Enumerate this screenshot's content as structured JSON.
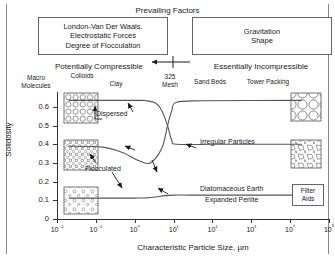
{
  "header": {
    "prevailing_factors": "Prevailing Factors",
    "left_box": {
      "line1": "London-Van Der Waals.",
      "line2": "Electrostatic Forces",
      "line3": "Degree of Flocculation"
    },
    "right_box": {
      "line1": "Gravitation",
      "line2": "Shape"
    }
  },
  "bands": {
    "potentially_compressible": "Potentially Compressible",
    "essentially_incompressible": "Essentially Incompressible",
    "items_left": [
      {
        "label_line1": "Macro",
        "label_line2": "Molecules"
      },
      {
        "label_line1": "Colloids",
        "label_line2": ""
      },
      {
        "label_line1": "Clay",
        "label_line2": ""
      }
    ],
    "items_right": [
      {
        "label_line1": "325",
        "label_line2": "Mesh"
      },
      {
        "label_line1": "Sand Beds",
        "label_line2": ""
      },
      {
        "label_line1": "Tower Packing",
        "label_line2": ""
      }
    ]
  },
  "annotations": {
    "dispersed": "Dispersed",
    "flocculated": "Flocculated",
    "irregular_particles": "Irregular Particles",
    "diatomaceous_earth": "Diatomaceous Earth",
    "expanded_perlite": "Expanded Perlite",
    "filter_aids_line1": "Filter",
    "filter_aids_line2": "Aids"
  },
  "chart_data": {
    "type": "line",
    "title": "",
    "xlabel": "Characteristic Particle Size, µm",
    "ylabel": "Solidosity",
    "xscale": "log",
    "xlim": [
      0.01,
      100000
    ],
    "ylim": [
      0,
      0.68
    ],
    "xticklabels": [
      "10⁻²",
      "10⁻¹",
      "10⁰",
      "10¹",
      "10²",
      "10³",
      "10⁴",
      "10⁵"
    ],
    "xtickvalues": [
      0.01,
      0.1,
      1,
      10,
      100,
      1000,
      10000,
      100000
    ],
    "yticklabels": [
      "0",
      "0.1",
      "0.2",
      "0.3",
      "0.4",
      "0.5",
      "0.6"
    ],
    "ytickvalues": [
      0,
      0.1,
      0.2,
      0.3,
      0.4,
      0.5,
      0.6
    ],
    "grid": false,
    "legend": "none",
    "series": [
      {
        "name": "Dispersed",
        "points": [
          [
            0.02,
            0.635
          ],
          [
            1.0,
            0.635
          ],
          [
            2.0,
            0.633
          ],
          [
            3.5,
            0.62
          ],
          [
            5.0,
            0.58
          ],
          [
            7.0,
            0.5
          ],
          [
            9.0,
            0.42
          ],
          [
            12.0,
            0.4
          ],
          [
            100,
            0.4
          ],
          [
            1000,
            0.4
          ],
          [
            20000,
            0.4
          ]
        ]
      },
      {
        "name": "Flocculated",
        "points": [
          [
            0.02,
            0.39
          ],
          [
            0.15,
            0.385
          ],
          [
            0.5,
            0.355
          ],
          [
            1.2,
            0.315
          ],
          [
            2.5,
            0.3
          ],
          [
            5.0,
            0.38
          ],
          [
            7.0,
            0.5
          ],
          [
            9.0,
            0.58
          ],
          [
            12.0,
            0.625
          ],
          [
            60,
            0.633
          ],
          [
            20000,
            0.635
          ]
        ]
      },
      {
        "name": "Filter Aids",
        "points": [
          [
            0.02,
            0.112
          ],
          [
            1.0,
            0.112
          ],
          [
            2.0,
            0.113
          ],
          [
            3.5,
            0.118
          ],
          [
            6.0,
            0.125
          ],
          [
            10.0,
            0.128
          ],
          [
            30.0,
            0.128
          ],
          [
            300,
            0.128
          ],
          [
            20000,
            0.128
          ]
        ]
      }
    ],
    "annotations": [
      {
        "text": "Dispersed",
        "x": 1.5,
        "y": 0.6
      },
      {
        "text": "Flocculated",
        "x": 0.6,
        "y": 0.24
      },
      {
        "text": "Irregular Particles",
        "x": 300,
        "y": 0.42
      },
      {
        "text": "Diatomaceous Earth",
        "x": 400,
        "y": 0.17
      },
      {
        "text": "Expanded Perlite",
        "x": 500,
        "y": 0.13
      }
    ]
  }
}
